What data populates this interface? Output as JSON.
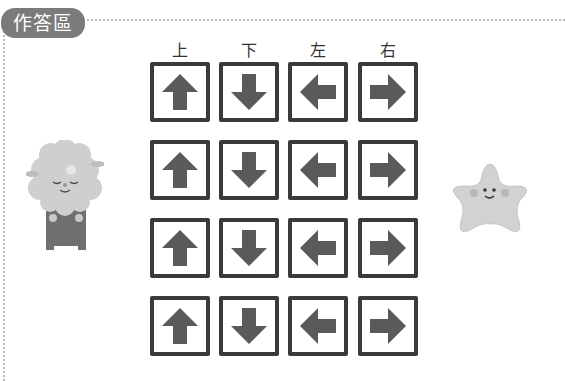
{
  "section_tag": "作答區",
  "columns": [
    {
      "label": "上",
      "direction": "up"
    },
    {
      "label": "下",
      "direction": "down"
    },
    {
      "label": "左",
      "direction": "left"
    },
    {
      "label": "右",
      "direction": "right"
    }
  ],
  "rows": 4,
  "characters": {
    "left": "sheep-character",
    "right": "star-character"
  },
  "colors": {
    "tag_bg": "#7b7b7b",
    "box_border": "#3a3a3a",
    "arrow": "#5a5a5a",
    "dotted_border": "#b9b9b9"
  }
}
